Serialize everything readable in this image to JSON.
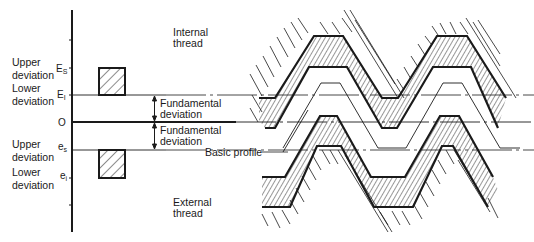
{
  "figure": {
    "axis": {
      "zero_label": "O",
      "upper_internal_symbol": "E",
      "upper_internal_sub": "S",
      "lower_internal_symbol": "E",
      "lower_internal_sub": "I",
      "upper_external_symbol": "e",
      "upper_external_sub": "s",
      "lower_external_symbol": "e",
      "lower_external_sub": "i"
    },
    "labels": {
      "upper_deviation_1_line1": "Upper",
      "upper_deviation_1_line2": "deviation",
      "lower_deviation_1_line1": "Lower",
      "lower_deviation_1_line2": "deviation",
      "upper_deviation_2_line1": "Upper",
      "upper_deviation_2_line2": "deviation",
      "lower_deviation_2_line1": "Lower",
      "lower_deviation_2_line2": "deviation",
      "fundamental_1_line1": "Fundamental",
      "fundamental_1_line2": "deviation",
      "fundamental_2_line1": "Fundamental",
      "fundamental_2_line2": "deviation",
      "internal_line1": "Internal",
      "internal_line2": "thread",
      "external_line1": "External",
      "external_line2": "thread",
      "basic_profile": "Basic profile"
    },
    "colors": {
      "ink": "#1a1a1a",
      "background": "#ffffff"
    }
  }
}
